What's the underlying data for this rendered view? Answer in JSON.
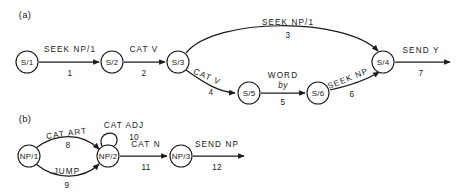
{
  "figure": {
    "background": "#ffffff",
    "ink": "#1a1a1a",
    "panels": [
      {
        "id": "a",
        "label": "(a)"
      },
      {
        "id": "b",
        "label": "(b)"
      }
    ]
  },
  "diagram_a": {
    "panel_label": "(a)",
    "nodes": [
      {
        "id": "S1",
        "label": "S/1",
        "cx": 27,
        "cy": 62,
        "r": 11
      },
      {
        "id": "S2",
        "label": "S/2",
        "cx": 112,
        "cy": 62,
        "r": 11
      },
      {
        "id": "S3",
        "label": "S/3",
        "cx": 178,
        "cy": 62,
        "r": 11
      },
      {
        "id": "S4",
        "label": "S/4",
        "cx": 383,
        "cy": 62,
        "r": 11
      },
      {
        "id": "S5",
        "label": "S/5",
        "cx": 249,
        "cy": 93,
        "r": 11
      },
      {
        "id": "S6",
        "label": "S/6",
        "cx": 318,
        "cy": 93,
        "r": 11
      }
    ],
    "edges": [
      {
        "id": "e1",
        "from": "S1",
        "to": "S2",
        "label": "SEEK NP/1",
        "number": "1"
      },
      {
        "id": "e2",
        "from": "S2",
        "to": "S3",
        "label": "CAT V",
        "number": "2"
      },
      {
        "id": "e3",
        "from": "S3",
        "to": "S4",
        "label": "SEEK NP/1",
        "number": "3"
      },
      {
        "id": "e4",
        "from": "S3",
        "to": "S5",
        "label": "CAT V",
        "number": "4"
      },
      {
        "id": "e5",
        "from": "S5",
        "to": "S6",
        "label": "WORD",
        "sublabel": "by",
        "number": "5"
      },
      {
        "id": "e6",
        "from": "S6",
        "to": "S4",
        "label": "SEEK NP",
        "number": "6"
      },
      {
        "id": "e7",
        "from": "S4",
        "to": "exit",
        "label": "SEND Y",
        "number": "7"
      }
    ]
  },
  "diagram_b": {
    "panel_label": "(b)",
    "nodes": [
      {
        "id": "NP1",
        "label": "NP/1",
        "cx": 29,
        "cy": 156,
        "r": 11
      },
      {
        "id": "NP2",
        "label": "NP/2",
        "cx": 108,
        "cy": 156,
        "r": 11
      },
      {
        "id": "NP3",
        "label": "NP/3",
        "cx": 181,
        "cy": 156,
        "r": 11
      }
    ],
    "edges": [
      {
        "id": "e8",
        "from": "NP1",
        "to": "NP2",
        "label": "CAT ART",
        "number": "8"
      },
      {
        "id": "e9",
        "from": "NP1",
        "to": "NP2",
        "label": "JUMP",
        "number": "9"
      },
      {
        "id": "e10",
        "from": "NP2",
        "to": "NP2",
        "label": "CAT ADJ",
        "number": "10"
      },
      {
        "id": "e11",
        "from": "NP2",
        "to": "NP3",
        "label": "CAT N",
        "number": "11"
      },
      {
        "id": "e12",
        "from": "NP3",
        "to": "exit",
        "label": "SEND NP",
        "number": "12"
      }
    ]
  }
}
